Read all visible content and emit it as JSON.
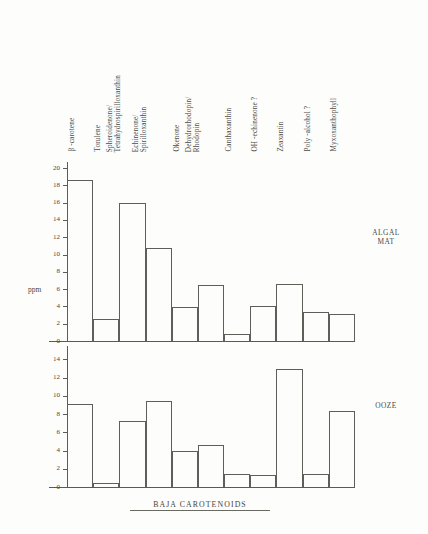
{
  "figure": {
    "caption": "BAJA CAROTENOIDS",
    "y_axis_label": "ppm"
  },
  "panels": {
    "top": {
      "name_line1": "ALGAL",
      "name_line2": "MAT"
    },
    "bottom": {
      "name_line1": "OOZE",
      "name_line2": ""
    }
  },
  "categories": [
    {
      "line1": "β -carotene",
      "line2": ""
    },
    {
      "line1": "Torulene",
      "line2": ""
    },
    {
      "line1": "Spheroidenone/",
      "line2": "Tetrahydrospirilloxanthin"
    },
    {
      "line1": "Echinenone/",
      "line2": "Spirilloxanthin"
    },
    {
      "line1": "Okenone",
      "line2": ""
    },
    {
      "line1": "Dehydrorhodopin/",
      "line2": "Rhodopin"
    },
    {
      "line1": "Canthaxanthin",
      "line2": ""
    },
    {
      "line1": "OH -echinenone ?",
      "line2": ""
    },
    {
      "line1": "Zeaxantin",
      "line2": ""
    },
    {
      "line1": "Poly -alcohol  ?",
      "line2": ""
    },
    {
      "line1": "Myxoxanthophyll",
      "line2": ""
    }
  ],
  "chart_data": {
    "type": "bar",
    "title": "BAJA CAROTENOIDS",
    "xlabel": "",
    "ylabel": "ppm",
    "grid": false,
    "legend": "none",
    "categories": [
      "β-carotene",
      "Torulene",
      "Spheroidenone/Tetrahydrospirilloxanthin",
      "Echinenone/Spirilloxanthin",
      "Okenone",
      "Dehydrorhodopin/Rhodopin",
      "Canthaxanthin",
      "OH-echinenone ?",
      "Zeaxantin",
      "Poly-alcohol ?",
      "Myxoxanthophyll"
    ],
    "panels": [
      {
        "name": "ALGAL MAT",
        "ylim": [
          0,
          20
        ],
        "yticks": [
          0,
          2,
          4,
          6,
          8,
          10,
          12,
          14,
          16,
          18,
          20
        ],
        "values": [
          18.6,
          2.5,
          15.9,
          10.8,
          3.9,
          6.5,
          0.8,
          4.1,
          6.6,
          3.4,
          3.1
        ]
      },
      {
        "name": "OOZE",
        "ylim": [
          0,
          14.8
        ],
        "yticks": [
          0,
          2,
          4,
          6,
          8,
          10,
          12,
          14
        ],
        "values": [
          9.1,
          0.4,
          7.2,
          9.4,
          4.0,
          4.6,
          1.4,
          1.3,
          12.9,
          1.4,
          8.3
        ]
      }
    ]
  }
}
